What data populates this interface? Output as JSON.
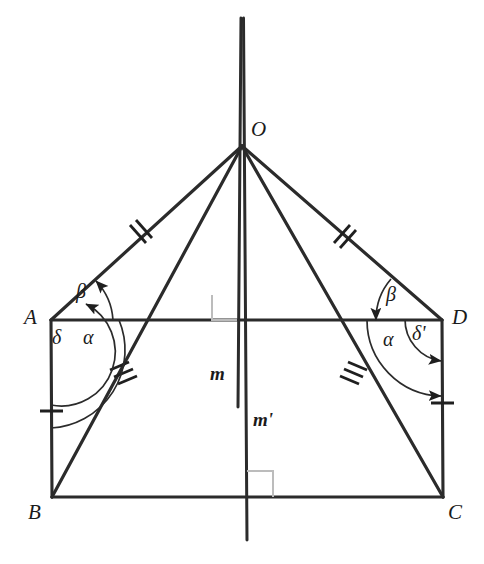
{
  "figure": {
    "background_color": "#ffffff",
    "stroke_color": "#2b2b2b",
    "thin_stroke_color": "#555555",
    "right_angle_color": "#b0b0b0",
    "width": 484,
    "height": 564
  },
  "points": [
    {
      "id": "O",
      "label": "O",
      "x": 242,
      "y": 145,
      "label_x": 252,
      "label_y": 122
    },
    {
      "id": "A",
      "label": "A",
      "x": 51,
      "y": 320,
      "label_x": 24,
      "label_y": 308
    },
    {
      "id": "D",
      "label": "D",
      "x": 442,
      "y": 320,
      "label_x": 452,
      "label_y": 308
    },
    {
      "id": "B",
      "label": "B",
      "x": 52,
      "y": 497,
      "label_x": 28,
      "label_y": 502
    },
    {
      "id": "C",
      "label": "C",
      "x": 443,
      "y": 497,
      "label_x": 448,
      "label_y": 502
    }
  ],
  "line_labels": [
    {
      "id": "m",
      "label": "m",
      "x": 214,
      "y": 366
    },
    {
      "id": "m2",
      "label": "m'",
      "x": 255,
      "y": 412
    }
  ],
  "angle_labels": [
    {
      "id": "beta-left",
      "label": "β",
      "x": 80,
      "y": 285
    },
    {
      "id": "alpha-left",
      "label": "α",
      "x": 85,
      "y": 330
    },
    {
      "id": "delta-left",
      "label": "δ",
      "x": 55,
      "y": 330
    },
    {
      "id": "beta-right",
      "label": "β",
      "x": 389,
      "y": 288
    },
    {
      "id": "alpha-right",
      "label": "α",
      "x": 386,
      "y": 332
    },
    {
      "id": "delta-right",
      "label": "δ'",
      "x": 416,
      "y": 327
    }
  ],
  "segments": [
    {
      "id": "OA",
      "from": "O",
      "to": "A",
      "ticks": 2
    },
    {
      "id": "OD",
      "from": "O",
      "to": "D",
      "ticks": 2
    },
    {
      "id": "OB",
      "from": "O",
      "to": "B",
      "ticks": 3
    },
    {
      "id": "OC",
      "from": "O",
      "to": "C",
      "ticks": 3
    },
    {
      "id": "AD",
      "from": "A",
      "to": "D",
      "ticks": 0
    },
    {
      "id": "BC",
      "from": "B",
      "to": "C",
      "ticks": 0
    },
    {
      "id": "AB",
      "from": "A",
      "to": "B",
      "ticks": 1
    },
    {
      "id": "DC",
      "from": "D",
      "to": "C",
      "ticks": 1
    }
  ],
  "axes": [
    {
      "id": "m",
      "label": "m",
      "x_top": 241,
      "y_top": 18,
      "x_bottom": 238,
      "y_bottom": 407
    },
    {
      "id": "m2",
      "label": "m'",
      "x_top": 243,
      "y_top": 18,
      "x_bottom": 247,
      "y_bottom": 540
    }
  ],
  "right_angles": [
    {
      "id": "right-angle-AD",
      "x": 212,
      "y": 291,
      "size": 25,
      "side": "left-above"
    },
    {
      "id": "right-angle-BC",
      "x": 249,
      "y": 470,
      "size": 26,
      "side": "right-above"
    }
  ]
}
